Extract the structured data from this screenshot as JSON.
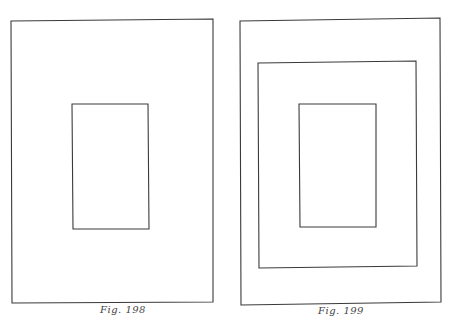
{
  "page": {
    "top_text_fragment": "· · ·"
  },
  "figures": [
    {
      "id": "fig-198",
      "caption": "Fig. 198",
      "rects": [
        {
          "role": "outer",
          "x": 11,
          "y": 20,
          "w": 202,
          "h": 283
        },
        {
          "role": "inner",
          "x": 72,
          "y": 104,
          "w": 77,
          "h": 125
        }
      ]
    },
    {
      "id": "fig-199",
      "caption": "Fig. 199",
      "rects": [
        {
          "role": "outer",
          "x": 240,
          "y": 20,
          "w": 201,
          "h": 285
        },
        {
          "role": "middle",
          "x": 258,
          "y": 62,
          "w": 159,
          "h": 206
        },
        {
          "role": "inner",
          "x": 299,
          "y": 104,
          "w": 77,
          "h": 123
        }
      ]
    }
  ],
  "colors": {
    "line": "#3a3a3a",
    "paper": "#ffffff"
  }
}
